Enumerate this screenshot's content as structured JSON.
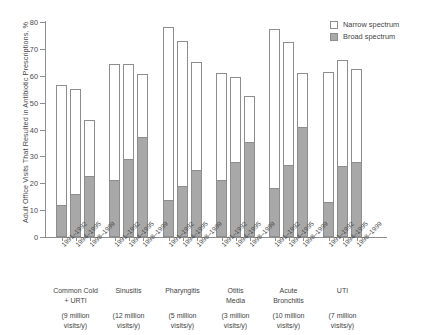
{
  "chart_data": {
    "type": "bar",
    "subtype": "stacked-grouped",
    "title": "",
    "xlabel": "",
    "ylabel": "Adult Office Visits That Resulted in Antibiotic Prescriptions, %",
    "ylim": [
      0,
      80
    ],
    "yticks": [
      0,
      10,
      20,
      30,
      40,
      50,
      60,
      70,
      80
    ],
    "ytick_labels": [
      "0",
      "10",
      "20",
      "30",
      "40",
      "50",
      "60",
      "70",
      "80"
    ],
    "grid": false,
    "legend_position": "top-right",
    "legend": [
      {
        "label": "Narrow spectrum",
        "color": "#ffffff",
        "key": "narrow"
      },
      {
        "label": "Broad spectrum",
        "color": "#a8a8a8",
        "key": "broad"
      }
    ],
    "periods": [
      "1991–1992",
      "1994–1995",
      "1998–1999"
    ],
    "groups": [
      {
        "name": "Common Cold\n+ URTI",
        "visits": "(9 million\nvisits/y)",
        "bars": [
          {
            "period": "1991–1992",
            "total": 56.5,
            "broad": 11.5,
            "narrow": 45.0
          },
          {
            "period": "1994–1995",
            "total": 55.0,
            "broad": 15.5,
            "narrow": 39.5
          },
          {
            "period": "1998–1999",
            "total": 43.5,
            "broad": 22.5,
            "narrow": 21.0
          }
        ]
      },
      {
        "name": "Sinusitis",
        "visits": "(12 million\nvisits/y)",
        "bars": [
          {
            "period": "1991–1992",
            "total": 64.5,
            "broad": 21.0,
            "narrow": 43.5
          },
          {
            "period": "1994–1995",
            "total": 64.5,
            "broad": 28.5,
            "narrow": 36.0
          },
          {
            "period": "1998–1999",
            "total": 60.5,
            "broad": 37.0,
            "narrow": 23.5
          }
        ]
      },
      {
        "name": "Pharyngitis",
        "visits": "(5 million\nvisits/y)",
        "bars": [
          {
            "period": "1991–1992",
            "total": 78.0,
            "broad": 13.5,
            "narrow": 64.5
          },
          {
            "period": "1994–1995",
            "total": 73.0,
            "broad": 18.5,
            "narrow": 54.5
          },
          {
            "period": "1998–1999",
            "total": 65.0,
            "broad": 24.5,
            "narrow": 40.5
          }
        ]
      },
      {
        "name": "Otitis\nMedia",
        "visits": "(3 million\nvisits/y)",
        "bars": [
          {
            "period": "1991–1992",
            "total": 61.0,
            "broad": 21.0,
            "narrow": 40.0
          },
          {
            "period": "1994–1995",
            "total": 59.5,
            "broad": 27.5,
            "narrow": 32.0
          },
          {
            "period": "1998–1999",
            "total": 52.5,
            "broad": 35.0,
            "narrow": 17.5
          }
        ]
      },
      {
        "name": "Acute\nBronchitis",
        "visits": "(10 million\nvisits/y)",
        "bars": [
          {
            "period": "1991–1992",
            "total": 77.5,
            "broad": 18.0,
            "narrow": 59.5
          },
          {
            "period": "1994–1995",
            "total": 72.5,
            "broad": 26.5,
            "narrow": 46.0
          },
          {
            "period": "1998–1999",
            "total": 61.0,
            "broad": 40.5,
            "narrow": 20.5
          }
        ]
      },
      {
        "name": "UTI",
        "visits": "(7 million\nvisits/y)",
        "bars": [
          {
            "period": "1991–1992",
            "total": 61.5,
            "broad": 12.5,
            "narrow": 49.0
          },
          {
            "period": "1994–1995",
            "total": 66.0,
            "broad": 26.0,
            "narrow": 40.0
          },
          {
            "period": "1998–1999",
            "total": 62.5,
            "broad": 27.5,
            "narrow": 35.0
          }
        ]
      }
    ]
  },
  "colors": {
    "narrow": "#ffffff",
    "broad": "#a8a8a8",
    "axis": "#8d8d8d",
    "text": "#3f3f3f",
    "background": "#ffffff"
  }
}
